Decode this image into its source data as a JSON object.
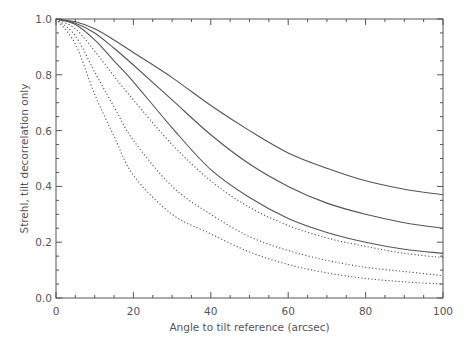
{
  "chart_data": {
    "type": "line",
    "title": "",
    "xlabel": "Angle to tilt reference (arcsec)",
    "ylabel": "Strehl, tilt decorrelation only",
    "xlim": [
      0,
      100
    ],
    "ylim": [
      0.0,
      1.0
    ],
    "grid": false,
    "legend": null,
    "x_ticks": [
      0,
      20,
      40,
      60,
      80,
      100
    ],
    "x_tick_labels": [
      "0",
      "20",
      "40",
      "60",
      "80",
      "100"
    ],
    "y_ticks": [
      0.0,
      0.2,
      0.4,
      0.6,
      0.8,
      1.0
    ],
    "y_tick_labels": [
      "0.0",
      "0.2",
      "0.4",
      "0.6",
      "0.8",
      "1.0"
    ],
    "x": [
      0,
      5,
      10,
      15,
      20,
      30,
      40,
      50,
      60,
      70,
      80,
      90,
      100
    ],
    "series": [
      {
        "name": "solid-1",
        "style": "solid",
        "values": [
          1.0,
          0.99,
          0.965,
          0.925,
          0.88,
          0.79,
          0.69,
          0.6,
          0.52,
          0.465,
          0.42,
          0.39,
          0.37
        ]
      },
      {
        "name": "solid-2",
        "style": "solid",
        "values": [
          1.0,
          0.985,
          0.95,
          0.895,
          0.835,
          0.71,
          0.585,
          0.48,
          0.4,
          0.34,
          0.3,
          0.27,
          0.25
        ]
      },
      {
        "name": "solid-3",
        "style": "solid",
        "values": [
          1.0,
          0.98,
          0.925,
          0.85,
          0.775,
          0.61,
          0.46,
          0.36,
          0.285,
          0.235,
          0.2,
          0.175,
          0.16
        ]
      },
      {
        "name": "dotted-1",
        "style": "dotted",
        "values": [
          1.0,
          0.965,
          0.885,
          0.795,
          0.71,
          0.55,
          0.42,
          0.325,
          0.26,
          0.215,
          0.185,
          0.16,
          0.145
        ]
      },
      {
        "name": "dotted-2",
        "style": "dotted",
        "values": [
          1.0,
          0.94,
          0.81,
          0.685,
          0.565,
          0.4,
          0.3,
          0.22,
          0.17,
          0.135,
          0.11,
          0.095,
          0.08
        ]
      },
      {
        "name": "dotted-3",
        "style": "dotted",
        "values": [
          1.0,
          0.91,
          0.73,
          0.58,
          0.44,
          0.3,
          0.23,
          0.165,
          0.12,
          0.09,
          0.07,
          0.058,
          0.05
        ]
      }
    ]
  },
  "layout": {
    "plot_left": 56,
    "plot_top": 19,
    "plot_right": 443,
    "plot_bottom": 298,
    "line_color": "#555555",
    "axis_color": "#555555"
  }
}
